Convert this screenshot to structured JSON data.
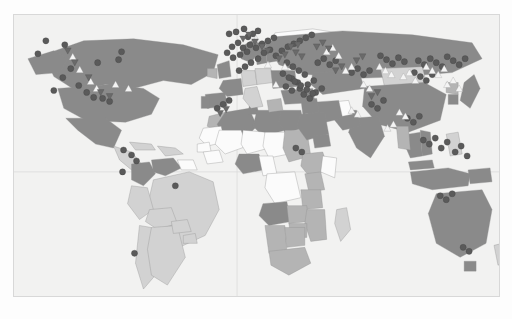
{
  "figure": {
    "type": "world-choropleth-map",
    "projection": "equirectangular",
    "background_color": "#fdfdfd",
    "ocean_color": "#f2f2f1",
    "frame_color": "#d8d8d8",
    "grid": {
      "visible": true,
      "color": "#dcdcdc",
      "vertical_meridian_x": 237,
      "horizontal_equator_y": 172
    },
    "fill_scale": {
      "no_data": "#fbfbfb",
      "low": "#d2d2d2",
      "medium": "#b4b4b4",
      "high": "#8a8a8a"
    },
    "marker_styles": {
      "circle": {
        "shape": "circle",
        "color": "#5a5a5a",
        "label": "circle-marker"
      },
      "triangle_up": {
        "shape": "triangle-up",
        "color": "#f4f4f4",
        "label": "triangle-up-marker"
      },
      "triangle_down": {
        "shape": "triangle-down",
        "color": "#6a6a6a",
        "label": "triangle-down-marker"
      }
    }
  },
  "chart_data": {
    "type": "heatmap",
    "title": "",
    "xlabel": "",
    "ylabel": "",
    "legend": [],
    "categories": [
      "no_data",
      "low",
      "medium",
      "high"
    ],
    "values": [
      0,
      1,
      2,
      3
    ],
    "regions": [
      {
        "name": "Greenland",
        "level": "no_data"
      },
      {
        "name": "Canada",
        "level": "high"
      },
      {
        "name": "United States",
        "level": "high"
      },
      {
        "name": "Mexico",
        "level": "high"
      },
      {
        "name": "Central America",
        "level": "low"
      },
      {
        "name": "Cuba",
        "level": "low"
      },
      {
        "name": "Caribbean",
        "level": "low"
      },
      {
        "name": "Colombia",
        "level": "high"
      },
      {
        "name": "Venezuela",
        "level": "high"
      },
      {
        "name": "Guyana",
        "level": "no_data"
      },
      {
        "name": "Brazil",
        "level": "low"
      },
      {
        "name": "Peru",
        "level": "low"
      },
      {
        "name": "Bolivia",
        "level": "low"
      },
      {
        "name": "Chile",
        "level": "low"
      },
      {
        "name": "Argentina",
        "level": "low"
      },
      {
        "name": "Paraguay",
        "level": "low"
      },
      {
        "name": "Uruguay",
        "level": "low"
      },
      {
        "name": "Morocco",
        "level": "medium"
      },
      {
        "name": "Algeria",
        "level": "high"
      },
      {
        "name": "Tunisia",
        "level": "high"
      },
      {
        "name": "Libya",
        "level": "high"
      },
      {
        "name": "Egypt",
        "level": "high"
      },
      {
        "name": "Mauritania",
        "level": "no_data"
      },
      {
        "name": "Mali",
        "level": "no_data"
      },
      {
        "name": "Niger",
        "level": "no_data"
      },
      {
        "name": "Chad",
        "level": "no_data"
      },
      {
        "name": "Sudan",
        "level": "medium"
      },
      {
        "name": "Senegal",
        "level": "no_data"
      },
      {
        "name": "Guinea",
        "level": "no_data"
      },
      {
        "name": "Nigeria",
        "level": "high"
      },
      {
        "name": "Cameroon",
        "level": "no_data"
      },
      {
        "name": "Ethiopia",
        "level": "medium"
      },
      {
        "name": "Somalia",
        "level": "no_data"
      },
      {
        "name": "Kenya",
        "level": "medium"
      },
      {
        "name": "DR Congo",
        "level": "no_data"
      },
      {
        "name": "Angola",
        "level": "high"
      },
      {
        "name": "Tanzania",
        "level": "medium"
      },
      {
        "name": "Zambia",
        "level": "medium"
      },
      {
        "name": "Mozambique",
        "level": "medium"
      },
      {
        "name": "Zimbabwe",
        "level": "medium"
      },
      {
        "name": "Namibia",
        "level": "medium"
      },
      {
        "name": "Botswana",
        "level": "medium"
      },
      {
        "name": "South Africa",
        "level": "medium"
      },
      {
        "name": "Madagascar",
        "level": "low"
      },
      {
        "name": "Norway",
        "level": "high"
      },
      {
        "name": "Sweden",
        "level": "high"
      },
      {
        "name": "Finland",
        "level": "high"
      },
      {
        "name": "United Kingdom",
        "level": "high"
      },
      {
        "name": "Ireland",
        "level": "medium"
      },
      {
        "name": "France",
        "level": "high"
      },
      {
        "name": "Spain",
        "level": "high"
      },
      {
        "name": "Portugal",
        "level": "high"
      },
      {
        "name": "Germany",
        "level": "low"
      },
      {
        "name": "Poland",
        "level": "low"
      },
      {
        "name": "Italy",
        "level": "low"
      },
      {
        "name": "Greece",
        "level": "medium"
      },
      {
        "name": "Ukraine",
        "level": "high"
      },
      {
        "name": "Turkey",
        "level": "high"
      },
      {
        "name": "Russia",
        "level": "high"
      },
      {
        "name": "Kazakhstan",
        "level": "high"
      },
      {
        "name": "Mongolia",
        "level": "low"
      },
      {
        "name": "China",
        "level": "high"
      },
      {
        "name": "India",
        "level": "high"
      },
      {
        "name": "Pakistan",
        "level": "high"
      },
      {
        "name": "Afghanistan",
        "level": "no_data"
      },
      {
        "name": "Iran",
        "level": "high"
      },
      {
        "name": "Iraq",
        "level": "high"
      },
      {
        "name": "Saudi Arabia",
        "level": "high"
      },
      {
        "name": "Yemen",
        "level": "high"
      },
      {
        "name": "Japan",
        "level": "high"
      },
      {
        "name": "South Korea",
        "level": "high"
      },
      {
        "name": "North Korea",
        "level": "medium"
      },
      {
        "name": "Thailand",
        "level": "high"
      },
      {
        "name": "Vietnam",
        "level": "high"
      },
      {
        "name": "Myanmar",
        "level": "medium"
      },
      {
        "name": "Malaysia",
        "level": "high"
      },
      {
        "name": "Indonesia",
        "level": "high"
      },
      {
        "name": "Philippines",
        "level": "low"
      },
      {
        "name": "Papua New Guinea",
        "level": "high"
      },
      {
        "name": "Australia",
        "level": "high"
      },
      {
        "name": "New Zealand",
        "level": "low"
      }
    ],
    "markers": {
      "circle": [
        [
          64,
          44
        ],
        [
          37,
          53
        ],
        [
          70,
          68
        ],
        [
          62,
          77
        ],
        [
          78,
          85
        ],
        [
          53,
          90
        ],
        [
          86,
          92
        ],
        [
          93,
          97
        ],
        [
          102,
          98
        ],
        [
          109,
          101
        ],
        [
          121,
          51
        ],
        [
          118,
          59
        ],
        [
          97,
          62
        ],
        [
          45,
          40
        ],
        [
          123,
          150
        ],
        [
          131,
          155
        ],
        [
          136,
          161
        ],
        [
          122,
          172
        ],
        [
          175,
          186
        ],
        [
          134,
          254
        ],
        [
          229,
          33
        ],
        [
          236,
          31
        ],
        [
          244,
          28
        ],
        [
          248,
          36
        ],
        [
          253,
          33
        ],
        [
          258,
          30
        ],
        [
          250,
          44
        ],
        [
          243,
          47
        ],
        [
          238,
          42
        ],
        [
          232,
          46
        ],
        [
          227,
          52
        ],
        [
          233,
          57
        ],
        [
          240,
          54
        ],
        [
          247,
          51
        ],
        [
          256,
          47
        ],
        [
          262,
          43
        ],
        [
          268,
          40
        ],
        [
          274,
          37
        ],
        [
          264,
          52
        ],
        [
          270,
          49
        ],
        [
          258,
          58
        ],
        [
          251,
          62
        ],
        [
          245,
          66
        ],
        [
          239,
          70
        ],
        [
          276,
          55
        ],
        [
          282,
          50
        ],
        [
          288,
          46
        ],
        [
          294,
          43
        ],
        [
          300,
          40
        ],
        [
          306,
          37
        ],
        [
          312,
          34
        ],
        [
          287,
          62
        ],
        [
          293,
          66
        ],
        [
          299,
          70
        ],
        [
          305,
          74
        ],
        [
          292,
          78
        ],
        [
          298,
          82
        ],
        [
          286,
          86
        ],
        [
          292,
          90
        ],
        [
          300,
          88
        ],
        [
          308,
          84
        ],
        [
          314,
          80
        ],
        [
          304,
          94
        ],
        [
          310,
          98
        ],
        [
          316,
          92
        ],
        [
          322,
          88
        ],
        [
          283,
          73
        ],
        [
          289,
          77
        ],
        [
          295,
          81
        ],
        [
          301,
          85
        ],
        [
          307,
          89
        ],
        [
          313,
          93
        ],
        [
          318,
          62
        ],
        [
          324,
          58
        ],
        [
          330,
          64
        ],
        [
          336,
          60
        ],
        [
          352,
          72
        ],
        [
          358,
          68
        ],
        [
          364,
          74
        ],
        [
          370,
          70
        ],
        [
          381,
          55
        ],
        [
          387,
          59
        ],
        [
          393,
          63
        ],
        [
          399,
          57
        ],
        [
          405,
          61
        ],
        [
          419,
          60
        ],
        [
          425,
          64
        ],
        [
          431,
          58
        ],
        [
          437,
          62
        ],
        [
          443,
          66
        ],
        [
          448,
          56
        ],
        [
          454,
          60
        ],
        [
          460,
          64
        ],
        [
          466,
          58
        ],
        [
          415,
          72
        ],
        [
          421,
          76
        ],
        [
          427,
          80
        ],
        [
          433,
          74
        ],
        [
          372,
          104
        ],
        [
          378,
          108
        ],
        [
          384,
          100
        ],
        [
          408,
          118
        ],
        [
          414,
          122
        ],
        [
          420,
          116
        ],
        [
          424,
          140
        ],
        [
          430,
          144
        ],
        [
          436,
          138
        ],
        [
          442,
          148
        ],
        [
          448,
          142
        ],
        [
          456,
          152
        ],
        [
          462,
          146
        ],
        [
          468,
          156
        ],
        [
          441,
          196
        ],
        [
          447,
          200
        ],
        [
          453,
          194
        ],
        [
          464,
          248
        ],
        [
          470,
          252
        ],
        [
          296,
          148
        ],
        [
          302,
          152
        ],
        [
          223,
          104
        ],
        [
          229,
          100
        ],
        [
          217,
          108
        ]
      ],
      "triangle_up": [
        [
          72,
          56
        ],
        [
          79,
          69
        ],
        [
          90,
          81
        ],
        [
          115,
          84
        ],
        [
          96,
          88
        ],
        [
          128,
          88
        ],
        [
          256,
          38
        ],
        [
          268,
          64
        ],
        [
          276,
          84
        ],
        [
          285,
          66
        ],
        [
          327,
          51
        ],
        [
          333,
          47
        ],
        [
          339,
          55
        ],
        [
          346,
          70
        ],
        [
          352,
          66
        ],
        [
          364,
          84
        ],
        [
          370,
          88
        ],
        [
          380,
          66
        ],
        [
          386,
          70
        ],
        [
          392,
          74
        ],
        [
          404,
          76
        ],
        [
          410,
          72
        ],
        [
          416,
          80
        ],
        [
          427,
          66
        ],
        [
          433,
          70
        ],
        [
          439,
          74
        ],
        [
          445,
          68
        ],
        [
          448,
          84
        ],
        [
          454,
          80
        ],
        [
          460,
          88
        ],
        [
          352,
          110
        ],
        [
          358,
          114
        ],
        [
          400,
          112
        ],
        [
          406,
          116
        ],
        [
          388,
          128
        ],
        [
          394,
          124
        ]
      ],
      "triangle_down": [
        [
          67,
          50
        ],
        [
          74,
          62
        ],
        [
          88,
          77
        ],
        [
          100,
          92
        ],
        [
          109,
          96
        ],
        [
          243,
          38
        ],
        [
          249,
          34
        ],
        [
          255,
          41
        ],
        [
          262,
          46
        ],
        [
          268,
          50
        ],
        [
          279,
          58
        ],
        [
          285,
          54
        ],
        [
          296,
          52
        ],
        [
          302,
          56
        ],
        [
          317,
          46
        ],
        [
          323,
          42
        ],
        [
          329,
          48
        ],
        [
          336,
          70
        ],
        [
          342,
          66
        ],
        [
          357,
          60
        ],
        [
          363,
          56
        ],
        [
          220,
          113
        ],
        [
          226,
          109
        ],
        [
          291,
          46
        ],
        [
          298,
          44
        ],
        [
          372,
          96
        ],
        [
          378,
          92
        ]
      ]
    }
  }
}
